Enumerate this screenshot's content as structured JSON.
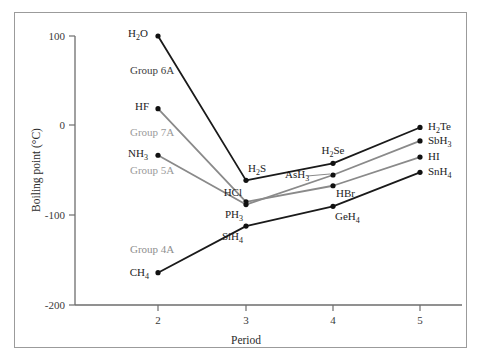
{
  "figure": {
    "background_color": "#ffffff",
    "border_color": "#9b9b9b",
    "axis_color": "#6d6d6d"
  },
  "axes": {
    "y_title": "Boiling point (°C)",
    "x_title": "Period",
    "y_ticks": [
      "100",
      "0",
      "-100",
      "-200"
    ],
    "x_ticks": [
      "2",
      "3",
      "4",
      "5"
    ]
  },
  "group_labels": [
    {
      "text": "Group 6A",
      "color": "#3d3d3d",
      "x": 130,
      "y": 74
    },
    {
      "text": "Group 7A",
      "color": "#9a9a9a",
      "x": 130,
      "y": 136
    },
    {
      "text": "Group 5A",
      "color": "#9a9a9a",
      "x": 130,
      "y": 174
    },
    {
      "text": "Group 4A",
      "color": "#8e8e8e",
      "x": 130,
      "y": 253
    }
  ],
  "chart_data": {
    "type": "line",
    "title": "",
    "xlabel": "Period",
    "ylabel": "Boiling point (°C)",
    "xlim": [
      1.6,
      5.5
    ],
    "ylim": [
      -200,
      100
    ],
    "x": [
      2,
      3,
      4,
      5
    ],
    "xticklabels": [
      "2",
      "3",
      "4",
      "5"
    ],
    "yticks": [
      100,
      0,
      -100,
      -200
    ],
    "grid": false,
    "legend": "none",
    "series": [
      {
        "name": "Group 6A",
        "color": "#1a1a1a",
        "values": [
          100,
          -61,
          -42,
          -2
        ],
        "point_labels": [
          "H2O",
          "H2S",
          "H2Se",
          "H2Te"
        ]
      },
      {
        "name": "Group 7A",
        "color": "#8a8a8a",
        "values": [
          19,
          -85,
          -67,
          -35
        ],
        "point_labels": [
          "HF",
          "HCl",
          "HBr",
          "HI"
        ]
      },
      {
        "name": "Group 5A",
        "color": "#8a8a8a",
        "values": [
          -33,
          -88,
          -55,
          -17
        ],
        "point_labels": [
          "NH3",
          "PH3",
          "AsH3",
          "SbH3"
        ]
      },
      {
        "name": "Group 4A",
        "color": "#1a1a1a",
        "values": [
          -164,
          -112,
          -90,
          -52
        ],
        "point_labels": [
          "CH4",
          "SiH4",
          "GeH4",
          "SnH4"
        ]
      }
    ]
  },
  "point_label_text": {
    "h2o": {
      "main": "H",
      "sub1": "2",
      "tail": "O"
    },
    "h2s": {
      "main": "H",
      "sub1": "2",
      "tail": "S"
    },
    "h2se": {
      "main": "H",
      "sub1": "2",
      "tail": "Se"
    },
    "h2te": {
      "main": "H",
      "sub1": "2",
      "tail": "Te"
    },
    "hf": {
      "main": "HF",
      "sub1": "",
      "tail": ""
    },
    "hcl": {
      "main": "HCl",
      "sub1": "",
      "tail": ""
    },
    "hbr": {
      "main": "HBr",
      "sub1": "",
      "tail": ""
    },
    "hi": {
      "main": "HI",
      "sub1": "",
      "tail": ""
    },
    "nh3": {
      "main": "NH",
      "sub1": "3",
      "tail": ""
    },
    "ph3": {
      "main": "PH",
      "sub1": "3",
      "tail": ""
    },
    "ash3": {
      "main": "AsH",
      "sub1": "3",
      "tail": ""
    },
    "sbh3": {
      "main": "SbH",
      "sub1": "3",
      "tail": ""
    },
    "ch4": {
      "main": "CH",
      "sub1": "4",
      "tail": ""
    },
    "sih4": {
      "main": "SiH",
      "sub1": "4",
      "tail": ""
    },
    "geh4": {
      "main": "GeH",
      "sub1": "4",
      "tail": ""
    },
    "snh4": {
      "main": "SnH",
      "sub1": "4",
      "tail": ""
    }
  }
}
